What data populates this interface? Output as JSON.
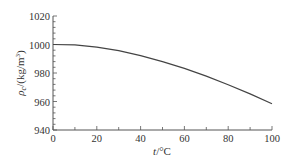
{
  "chart_data": {
    "type": "line",
    "title": "",
    "xlabel": "t/°C",
    "ylabel": "ρc/(kg/m³)",
    "ylabel_parts": {
      "symbol": "ρ",
      "sub": "c",
      "unit": "/(kg/m",
      "sup": "3",
      "close": ")"
    },
    "xlabel_parts": {
      "symbol": "t",
      "unit": "/°C"
    },
    "xlim": [
      0,
      100
    ],
    "ylim": [
      940,
      1020
    ],
    "xticks": [
      0,
      20,
      40,
      60,
      80,
      100
    ],
    "yticks": [
      940,
      960,
      980,
      1000,
      1020
    ],
    "x_minor_step": 10,
    "y_minor_step": 4,
    "grid": false,
    "legend": null,
    "series": [
      {
        "name": "density",
        "color": "#444444",
        "x": [
          0,
          10,
          20,
          30,
          40,
          50,
          60,
          70,
          80,
          90,
          100
        ],
        "values": [
          1000.0,
          999.7,
          998.2,
          995.7,
          992.2,
          988.0,
          983.2,
          977.8,
          971.8,
          965.3,
          958.4
        ]
      }
    ]
  }
}
